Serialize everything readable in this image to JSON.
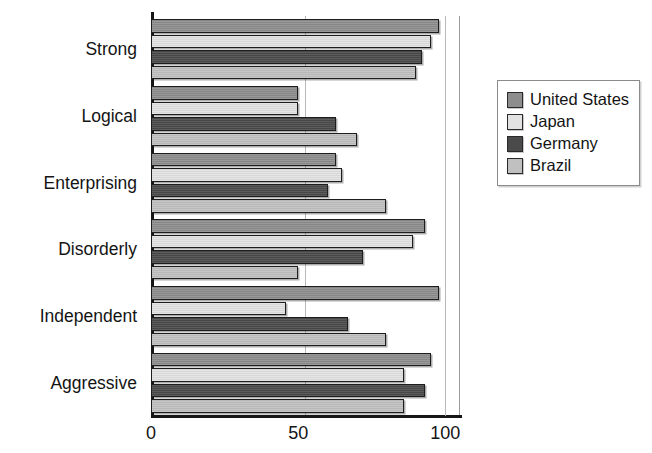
{
  "chart_data": {
    "type": "bar",
    "orientation": "horizontal",
    "title": "",
    "xlabel": "",
    "ylabel": "",
    "xlim": [
      0,
      105
    ],
    "xticks": [
      0,
      50,
      100
    ],
    "xtick_labels": [
      "0",
      "50",
      "100"
    ],
    "grid": true,
    "grid_axis": "x",
    "legend_position": "right",
    "categories": [
      "Strong",
      "Logical",
      "Enterprising",
      "Disorderly",
      "Independent",
      "Aggressive"
    ],
    "series": [
      {
        "name": "United States",
        "color": "#8d8d8d",
        "values": [
          98,
          50,
          63,
          93,
          98,
          95
        ]
      },
      {
        "name": "Japan",
        "color": "#e2e2e2",
        "values": [
          95,
          50,
          65,
          89,
          46,
          86
        ]
      },
      {
        "name": "Germany",
        "color": "#4a4a4a",
        "values": [
          92,
          63,
          60,
          72,
          67,
          93
        ]
      },
      {
        "name": "Brazil",
        "color": "#c0c0c0",
        "values": [
          90,
          70,
          80,
          50,
          80,
          86
        ]
      }
    ]
  },
  "legend": {
    "items": [
      {
        "label": "United States",
        "swatch": "#8d8d8d"
      },
      {
        "label": "Japan",
        "swatch": "#e2e2e2"
      },
      {
        "label": "Germany",
        "swatch": "#4a4a4a"
      },
      {
        "label": "Brazil",
        "swatch": "#c0c0c0"
      }
    ]
  },
  "colors": {
    "axis": "#161616",
    "gridline": "#b9b9b9",
    "bar_outline": "#1d1d1d",
    "background": "#ffffff"
  }
}
